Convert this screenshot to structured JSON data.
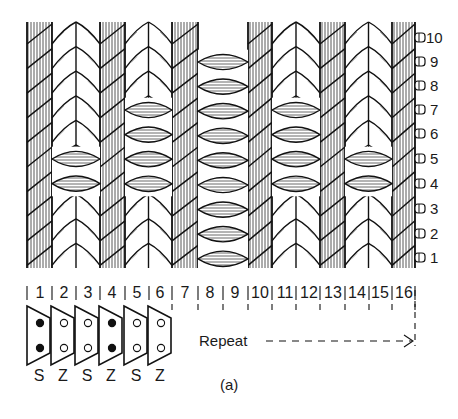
{
  "figure": {
    "caption": "(a)",
    "repeat_label": "Repeat",
    "colors": {
      "ink": "#111111",
      "paper": "#ffffff",
      "hatch": "#555555"
    }
  },
  "columns": {
    "labels": [
      "1",
      "2",
      "3",
      "4",
      "5",
      "6",
      "7",
      "8",
      "9",
      "10",
      "11",
      "12",
      "13",
      "14",
      "15",
      "16"
    ]
  },
  "rows": {
    "labels": [
      "10",
      "9",
      "8",
      "7",
      "6",
      "5",
      "4",
      "3",
      "2",
      "1"
    ]
  },
  "cards": {
    "items": [
      {
        "index": "1",
        "top_hole": "filled",
        "bottom_hole": "filled",
        "twist": "S"
      },
      {
        "index": "2",
        "top_hole": "empty",
        "bottom_hole": "empty",
        "twist": "Z"
      },
      {
        "index": "3",
        "top_hole": "empty",
        "bottom_hole": "empty",
        "twist": "S"
      },
      {
        "index": "4",
        "top_hole": "filled",
        "bottom_hole": "filled",
        "twist": "Z"
      },
      {
        "index": "5",
        "top_hole": "empty",
        "bottom_hole": "empty",
        "twist": "S"
      },
      {
        "index": "6",
        "top_hole": "empty",
        "bottom_hole": "empty",
        "twist": "Z"
      }
    ]
  },
  "structure": {
    "hatched_wales_columns": [
      "1",
      "4",
      "7",
      "10",
      "13",
      "16"
    ],
    "chevron_wales_columns": [
      [
        "2",
        "3"
      ],
      [
        "5",
        "6"
      ],
      [
        "11",
        "12"
      ],
      [
        "14",
        "15"
      ]
    ],
    "weft_float_blocks": [
      {
        "columns": [
          "2",
          "3"
        ],
        "rows": [
          "4",
          "5"
        ]
      },
      {
        "columns": [
          "5",
          "6"
        ],
        "rows": [
          "4",
          "5",
          "6",
          "7"
        ]
      },
      {
        "columns": [
          "8",
          "9"
        ],
        "rows": [
          "1",
          "2",
          "3",
          "4",
          "5",
          "6",
          "7",
          "8",
          "9"
        ]
      },
      {
        "columns": [
          "11",
          "12"
        ],
        "rows": [
          "4",
          "5",
          "6",
          "7"
        ]
      },
      {
        "columns": [
          "14",
          "15"
        ],
        "rows": [
          "4",
          "5"
        ]
      }
    ]
  }
}
